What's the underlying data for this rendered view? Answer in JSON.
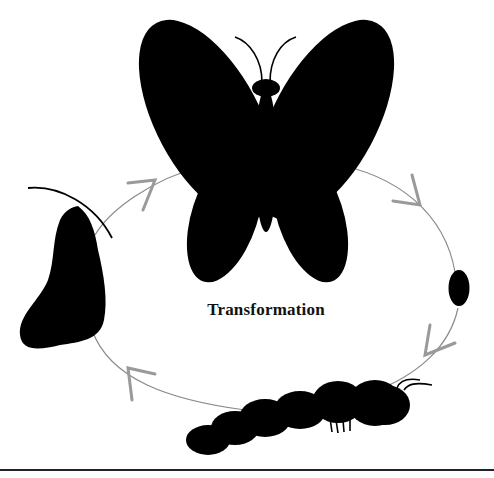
{
  "diagram": {
    "title": "Transformation",
    "type": "life-cycle",
    "stages": [
      {
        "name": "adult butterfly",
        "position": "top"
      },
      {
        "name": "egg",
        "position": "right"
      },
      {
        "name": "caterpillar (larva)",
        "position": "bottom"
      },
      {
        "name": "chrysalis (pupa)",
        "position": "left"
      }
    ],
    "flow_direction": "clockwise",
    "arrow_count": 4
  },
  "colors": {
    "background": "#ffffff",
    "silhouette": "#000000",
    "cycle_line": "#8a8a8a",
    "arrowhead": "#9a9a9a",
    "text": "#111111",
    "rule": "#222222"
  }
}
